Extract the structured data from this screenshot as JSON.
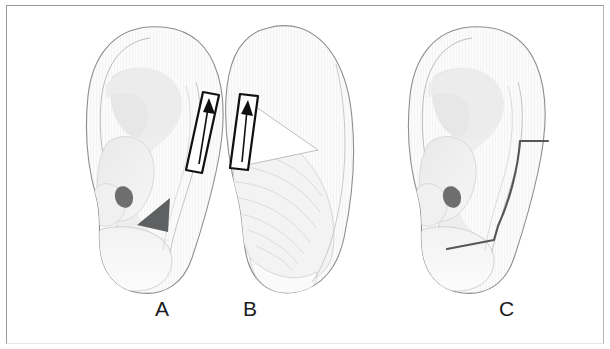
{
  "figure": {
    "background_color": "#ffffff",
    "border_color": "#9a9a9a",
    "width": 610,
    "height": 349
  },
  "palette": {
    "outline": "#8d8f93",
    "outline_soft": "#b9bbbe",
    "skin_fill": "#fbfbfb",
    "shade_light": "#f1f1f2",
    "shade_mid": "#e4e4e5",
    "shade_deep": "#d6d6d7",
    "meatus_dark": "#6e6e6e",
    "marker_dark": "#5f6062",
    "arrow_stroke": "#101010",
    "incision_line": "#55565a",
    "hatch_line": "#dcdcdd",
    "label_text": "#1c1c1c"
  },
  "panels": [
    {
      "id": "panel-a",
      "label": "A",
      "label_x": 155,
      "label_y": 298,
      "view": "anterior-lateral view of auricle",
      "annotations": [
        {
          "name": "elevation-arrow",
          "type": "outlined-block-arrow",
          "direction": "up",
          "x": 196,
          "y": 92,
          "length": 78
        },
        {
          "name": "triangular-marker",
          "type": "solid-triangle",
          "direction": "down-left",
          "x": 150,
          "y": 205
        },
        {
          "name": "meatus-spot",
          "type": "filled-ellipse",
          "x": 124,
          "y": 196
        }
      ]
    },
    {
      "id": "panel-b",
      "label": "B",
      "label_x": 243,
      "label_y": 298,
      "view": "posterior (retroauricular) view with cartilage scoring",
      "annotations": [
        {
          "name": "elevation-arrow",
          "type": "outlined-block-arrow",
          "direction": "up",
          "x": 234,
          "y": 94,
          "length": 76
        },
        {
          "name": "scoring-hatch",
          "type": "curved-parallel-lines",
          "count": 7
        },
        {
          "name": "exposed-wedge",
          "type": "white-triangle-wedge"
        }
      ]
    },
    {
      "id": "panel-c",
      "label": "C",
      "label_x": 499,
      "label_y": 298,
      "view": "anterior-lateral view after closure showing incision line",
      "annotations": [
        {
          "name": "incision-line",
          "type": "stepped-curved-line",
          "start_x": 520,
          "start_y": 142,
          "end_x": 447,
          "end_y": 248
        },
        {
          "name": "meatus-spot",
          "type": "filled-ellipse",
          "x": 452,
          "y": 200
        }
      ]
    }
  ],
  "labels": {
    "a": "A",
    "b": "B",
    "c": "C"
  }
}
